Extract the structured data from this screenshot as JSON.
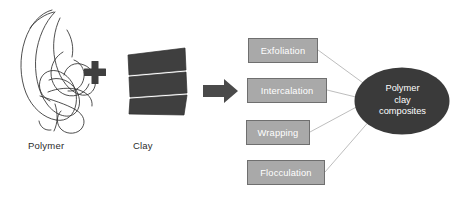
{
  "figure": {
    "width": 459,
    "height": 200,
    "background": "#ffffff"
  },
  "reactants": [
    {
      "id": "polymer",
      "label": "Polymer",
      "glyph": "polymer-scribble",
      "color": "#2f2f2f"
    },
    {
      "id": "clay",
      "label": "Clay",
      "glyph": "clay-layered-block",
      "color": "#3f3f3f"
    }
  ],
  "operators": {
    "plus": "+",
    "arrow": "arrow-right"
  },
  "structures": {
    "box_fill": "#a9a9a9",
    "box_border": "#6f6f6f",
    "box_text_color": "#ffffff",
    "items": [
      {
        "label": "Exfoliation"
      },
      {
        "label": "Intercalation"
      },
      {
        "label": "Wrapping"
      },
      {
        "label": "Flocculation"
      }
    ]
  },
  "product": {
    "lines": [
      "Polymer",
      "clay",
      "composites"
    ],
    "fill": "#3a3a3a",
    "text_color": "#ffffff"
  },
  "connectors": {
    "color": "#b5b5b5",
    "count": 4
  }
}
